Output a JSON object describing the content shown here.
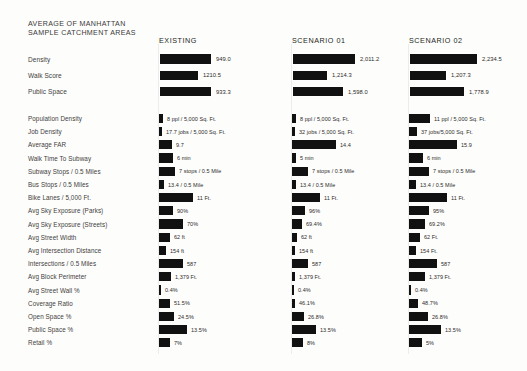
{
  "header": {
    "title": "AVERAGE OF MANHATTAN\nSAMPLE CATCHMENT AREAS",
    "columns": [
      "EXISTING",
      "SCENARIO 01",
      "SCENARIO 02"
    ]
  },
  "style": {
    "bar_color": "#111111",
    "background": "#fdfdfc",
    "text_color": "#231f20"
  },
  "chart_data": {
    "type": "bar",
    "title": "AVERAGE OF MANHATTAN SAMPLE CATCHMENT AREAS",
    "orientation": "horizontal",
    "series": [
      "EXISTING",
      "SCENARIO 01",
      "SCENARIO 02"
    ],
    "groups": [
      {
        "name": "summary",
        "rows": [
          {
            "label": "Density",
            "cells": [
              {
                "text": "949.0",
                "value": 949.0,
                "width": 53
              },
              {
                "text": "2,011.2",
                "value": 2011.2,
                "width": 64
              },
              {
                "text": "2,234.5",
                "value": 2234.5,
                "width": 69
              }
            ],
            "max": 2234.5
          },
          {
            "label": "Walk Score",
            "cells": [
              {
                "text": "1210.5",
                "value": 1210.5,
                "width": 40
              },
              {
                "text": "1,214.3",
                "value": 1214.3,
                "width": 36
              },
              {
                "text": "1,207.3",
                "value": 1207.3,
                "width": 38
              }
            ],
            "max": 1214.3
          },
          {
            "label": "Public Space",
            "cells": [
              {
                "text": "933.3",
                "value": 933.3,
                "width": 53
              },
              {
                "text": "1,598.0",
                "value": 1598.0,
                "width": 52
              },
              {
                "text": "1,778.9",
                "value": 1778.9,
                "width": 56
              }
            ],
            "max": 1778.9
          }
        ]
      },
      {
        "name": "detail",
        "rows": [
          {
            "label": "Population Density",
            "cells": [
              {
                "text": "8 ppl / 5,000 Sq. Ft.",
                "value": 8,
                "width": 4
              },
              {
                "text": "8 ppl / 5,000 Sq. Ft.",
                "value": 8,
                "width": 4
              },
              {
                "text": "11 ppl / 5,000 Sq. Ft.",
                "value": 11,
                "width": 21
              }
            ],
            "max": 11
          },
          {
            "label": "Job Density",
            "cells": [
              {
                "text": "17.7 jobs / 5,000 Sq. Ft.",
                "value": 17.7,
                "width": 3
              },
              {
                "text": "32 jobs / 5,000 Sq. Ft.",
                "value": 32,
                "width": 3
              },
              {
                "text": "37 jobs/5,000 Sq. Ft.",
                "value": 37,
                "width": 8
              }
            ],
            "max": 37
          },
          {
            "label": "Average FAR",
            "cells": [
              {
                "text": "9.7",
                "value": 9.7,
                "width": 13
              },
              {
                "text": "14.4",
                "value": 14.4,
                "width": 44
              },
              {
                "text": "15.9",
                "value": 15.9,
                "width": 48
              }
            ],
            "max": 15.9
          },
          {
            "label": "Walk Time To Subway",
            "cells": [
              {
                "text": "6 min",
                "value": 6,
                "width": 14
              },
              {
                "text": "5 min",
                "value": 5,
                "width": 4
              },
              {
                "text": "6 min",
                "value": 6,
                "width": 14
              }
            ],
            "max": 6
          },
          {
            "label": "Subway Stops / 0.5 Miles",
            "cells": [
              {
                "text": "7 stops / 0.5 Mile",
                "value": 7,
                "width": 16
              },
              {
                "text": "7 stops / 0.5 Mile",
                "value": 7,
                "width": 16
              },
              {
                "text": "7 stops / 0.5 Mile",
                "value": 7,
                "width": 20
              }
            ],
            "max": 7
          },
          {
            "label": "Bus Stops / 0.5 Miles",
            "cells": [
              {
                "text": "13.4 / 0.5 Mile",
                "value": 13.4,
                "width": 5
              },
              {
                "text": "13.4 / 0.5 Mile",
                "value": 13.4,
                "width": 4
              },
              {
                "text": "13.4 / 0.5 Mile",
                "value": 13.4,
                "width": 7
              }
            ],
            "max": 13.4
          },
          {
            "label": "Bike Lanes / 5,000 Ft.",
            "cells": [
              {
                "text": "11 Ft.",
                "value": 11,
                "width": 34
              },
              {
                "text": "11 Ft.",
                "value": 11,
                "width": 28
              },
              {
                "text": "11 Ft.",
                "value": 11,
                "width": 38
              }
            ],
            "max": 11
          },
          {
            "label": "Avg Sky Exposure (Parks)",
            "cells": [
              {
                "text": "90%",
                "value": 90,
                "width": 14
              },
              {
                "text": "96%",
                "value": 96,
                "width": 13
              },
              {
                "text": "95%",
                "value": 95,
                "width": 20
              }
            ],
            "max": 96
          },
          {
            "label": "Avg Sky Exposure (Streets)",
            "cells": [
              {
                "text": "70%",
                "value": 70,
                "width": 24
              },
              {
                "text": "69.4%",
                "value": 69.4,
                "width": 10
              },
              {
                "text": "69.2%",
                "value": 69.2,
                "width": 16
              }
            ],
            "max": 70
          },
          {
            "label": "Avg Street Width",
            "cells": [
              {
                "text": "62 ft",
                "value": 62,
                "width": 11
              },
              {
                "text": "62 ft",
                "value": 62,
                "width": 5
              },
              {
                "text": "62 Ft.",
                "value": 62,
                "width": 11
              }
            ],
            "max": 62
          },
          {
            "label": "Avg Intersection Distance",
            "cells": [
              {
                "text": "154 ft",
                "value": 154,
                "width": 7
              },
              {
                "text": "154 ft",
                "value": 154,
                "width": 3
              },
              {
                "text": "154 Ft.",
                "value": 154,
                "width": 7
              }
            ],
            "max": 154
          },
          {
            "label": "Intersections / 0.5 Miles",
            "cells": [
              {
                "text": "587",
                "value": 587,
                "width": 24
              },
              {
                "text": "587",
                "value": 587,
                "width": 16
              },
              {
                "text": "587",
                "value": 587,
                "width": 28
              }
            ],
            "max": 587
          },
          {
            "label": "Avg Block Perimeter",
            "cells": [
              {
                "text": "1,379 Ft.",
                "value": 1379,
                "width": 12
              },
              {
                "text": "1,379 Ft.",
                "value": 1379,
                "width": 3
              },
              {
                "text": "1,379 Ft.",
                "value": 1379,
                "width": 16
              }
            ],
            "max": 1379
          },
          {
            "label": "Avg Street Wall %",
            "cells": [
              {
                "text": "0.4%",
                "value": 0.4,
                "width": 2
              },
              {
                "text": "0.4%",
                "value": 0.4,
                "width": 2
              },
              {
                "text": "0.4%",
                "value": 0.4,
                "width": 2
              }
            ],
            "max": 0.4
          },
          {
            "label": "Coverage Ratio",
            "cells": [
              {
                "text": "51.5%",
                "value": 51.5,
                "width": 11
              },
              {
                "text": "46.1%",
                "value": 46.1,
                "width": 3
              },
              {
                "text": "48.7%",
                "value": 48.7,
                "width": 9
              }
            ],
            "max": 51.5
          },
          {
            "label": "Open Space %",
            "cells": [
              {
                "text": "24.5%",
                "value": 24.5,
                "width": 15
              },
              {
                "text": "26.8%",
                "value": 26.8,
                "width": 12
              },
              {
                "text": "26.8%",
                "value": 26.8,
                "width": 19
              }
            ],
            "max": 26.8
          },
          {
            "label": "Public Space %",
            "cells": [
              {
                "text": "13.5%",
                "value": 13.5,
                "width": 28
              },
              {
                "text": "13.5%",
                "value": 13.5,
                "width": 24
              },
              {
                "text": "13.5%",
                "value": 13.5,
                "width": 32
              }
            ],
            "max": 13.5
          },
          {
            "label": "Retail %",
            "cells": [
              {
                "text": "7%",
                "value": 7,
                "width": 11
              },
              {
                "text": "8%",
                "value": 8,
                "width": 11
              },
              {
                "text": "5%",
                "value": 5,
                "width": 13
              }
            ],
            "max": 8
          }
        ]
      }
    ]
  }
}
